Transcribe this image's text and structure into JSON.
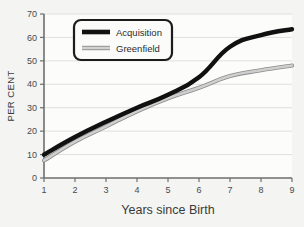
{
  "chart_data": {
    "type": "line",
    "title": "",
    "xlabel": "Years since Birth",
    "ylabel": "PER CENT",
    "xlim": [
      1,
      9
    ],
    "ylim": [
      0,
      70
    ],
    "x": [
      1,
      2,
      3,
      4,
      5,
      6,
      7,
      8,
      9
    ],
    "xticks": [
      "1",
      "2",
      "3",
      "4",
      "5",
      "6",
      "7",
      "8",
      "9"
    ],
    "yticks": [
      "0",
      "10",
      "20",
      "30",
      "40",
      "50",
      "60",
      "70"
    ],
    "grid": "horizontal",
    "legend_position": "upper-left",
    "series": [
      {
        "name": "Acquisition",
        "color": "#111111",
        "values": [
          10,
          17.5,
          24,
          30,
          35.5,
          43,
          56,
          61,
          63.5
        ]
      },
      {
        "name": "Greenfield",
        "color": "#cfcfcf",
        "values": [
          7.5,
          15.5,
          22,
          28.5,
          34,
          38.5,
          43.5,
          46,
          48
        ]
      }
    ]
  },
  "legend": {
    "items": [
      {
        "label": "Acquisition"
      },
      {
        "label": "Greenfield"
      }
    ]
  },
  "axes": {
    "x_title": "Years since Birth",
    "y_title": "PER CENT"
  }
}
